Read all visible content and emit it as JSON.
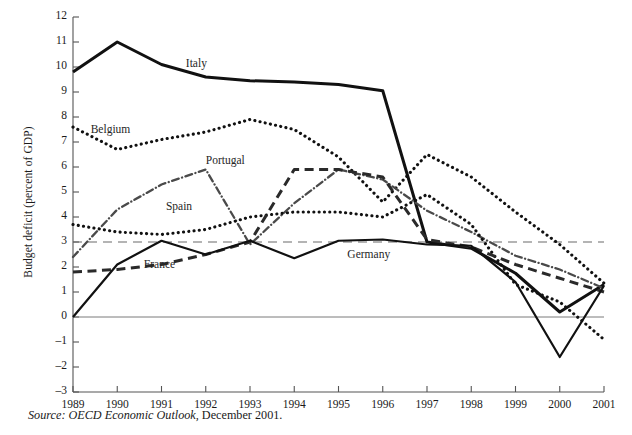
{
  "figure": {
    "source_note_italic": "Source: OECD Economic Outlook,",
    "source_note_rest": " December 2001."
  },
  "chart_data": {
    "type": "line",
    "title": "",
    "xlabel": "",
    "ylabel": "Budget deficit (percent of GDP)",
    "x": [
      1989,
      1990,
      1991,
      1992,
      1993,
      1994,
      1995,
      1996,
      1997,
      1998,
      1999,
      2000,
      2001
    ],
    "xticklabels": [
      "1989",
      "1990",
      "1991",
      "1992",
      "1993",
      "1994",
      "1995",
      "1996",
      "1997",
      "1998",
      "1999",
      "2000",
      "2001"
    ],
    "yticklabels": [
      "12",
      "11",
      "10",
      "9",
      "8",
      "7",
      "6",
      "5",
      "4",
      "3",
      "2",
      "1",
      "0",
      "-1",
      "-2",
      "-3"
    ],
    "ytickvalues": [
      12,
      11,
      10,
      9,
      8,
      7,
      6,
      5,
      4,
      3,
      2,
      1,
      0,
      -1,
      -2,
      -3
    ],
    "ylim": [
      -3,
      12
    ],
    "xlim": [
      1989,
      2001
    ],
    "grid": false,
    "legend_position": "inline-annotations",
    "reference_line": {
      "value": 3,
      "style": "dashed",
      "label": "Maastricht 3 percent limit"
    },
    "zero_line": {
      "value": 0,
      "style": "solid-thin"
    },
    "series": [
      {
        "name": "Italy",
        "style": "solid-thick",
        "color": "#111111",
        "label_x": 1991.55,
        "label_y": 10.1,
        "values": [
          9.8,
          11.0,
          10.1,
          9.6,
          9.45,
          9.4,
          9.3,
          9.05,
          3.0,
          2.75,
          1.75,
          0.2,
          1.3
        ]
      },
      {
        "name": "Belgium",
        "style": "dotted",
        "color": "#111111",
        "label_x": 1989.4,
        "label_y": 7.45,
        "values": [
          7.6,
          6.7,
          7.1,
          7.4,
          7.9,
          7.5,
          6.4,
          4.6,
          6.5,
          5.6,
          4.2,
          2.9,
          1.35
        ]
      },
      {
        "name": "Portugal",
        "style": "dash-dot-fine",
        "color": "#4a4a4a",
        "label_x": 1992.0,
        "label_y": 6.2,
        "values": [
          2.4,
          4.3,
          5.3,
          5.9,
          2.9,
          4.55,
          5.9,
          5.5,
          4.25,
          3.4,
          2.45,
          1.9,
          1.15
        ]
      },
      {
        "name": "Spain",
        "style": "dotted",
        "color": "#111111",
        "label_x": 1991.1,
        "label_y": 4.35,
        "values": [
          3.7,
          3.4,
          3.3,
          3.5,
          4.0,
          4.2,
          4.2,
          4.0,
          4.9,
          3.7,
          1.3,
          0.6,
          -0.9
        ]
      },
      {
        "name": "France",
        "style": "dashed-thick",
        "color": "#2a2a2a",
        "label_x": 1990.6,
        "label_y": 2.05,
        "values": [
          1.8,
          1.9,
          2.1,
          2.5,
          3.0,
          5.9,
          5.9,
          5.6,
          3.1,
          2.8,
          2.1,
          1.55,
          1.0
        ]
      },
      {
        "name": "Germany",
        "style": "solid-medium",
        "color": "#111111",
        "label_x": 1995.2,
        "label_y": 2.45,
        "values": [
          0.0,
          2.1,
          3.05,
          2.5,
          3.05,
          2.35,
          3.05,
          3.1,
          2.9,
          2.85,
          1.4,
          -1.6,
          1.25
        ]
      }
    ]
  }
}
